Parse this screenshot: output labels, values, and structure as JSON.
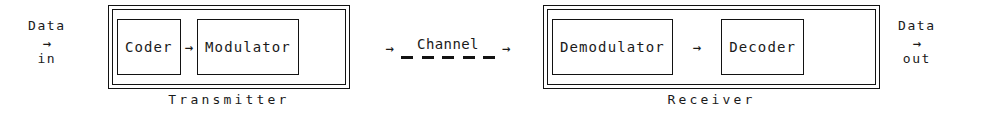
{
  "diagram": {
    "ink_color": "#121212",
    "background_color": "#ffffff"
  },
  "input_terminal": {
    "name": "data-in",
    "word_top": "Data",
    "arrow": "→",
    "word_bottom": "in"
  },
  "output_terminal": {
    "name": "data-out",
    "word_top": "Data",
    "arrow": "→",
    "word_bottom": "out"
  },
  "transmitter": {
    "caption": "Transmitter",
    "blocks": [
      {
        "label": "Coder"
      },
      {
        "label": "Modulator"
      }
    ],
    "internal_arrow": "→"
  },
  "channel": {
    "label": "Channel",
    "arrow_in": "→",
    "arrow_out": "→",
    "dash_count": 5,
    "line_style": "dashed"
  },
  "receiver": {
    "caption": "Receiver",
    "blocks": [
      {
        "label": "Demodulator"
      },
      {
        "label": "Decoder"
      }
    ],
    "internal_arrow": "→"
  }
}
